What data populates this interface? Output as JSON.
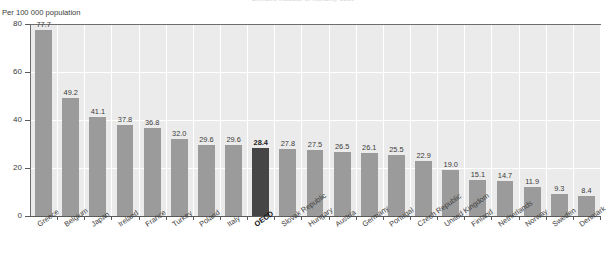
{
  "axis_unit_label": "Per 100 000 population",
  "clipped_title": "Selected indicator of mortality, 2009",
  "colors": {
    "bar": "#9b9b9b",
    "bar_highlight": "#454545",
    "plot_background": "#ebebeb",
    "gridline": "#ffffff",
    "axis": "#5a5a5a",
    "text": "#3b3b3b"
  },
  "chart_data": {
    "type": "bar",
    "title": "Selected indicator of mortality, 2009",
    "xlabel": "",
    "ylabel": "Per 100 000 population",
    "ylim": [
      0,
      80
    ],
    "yticks": [
      0,
      20,
      40,
      60,
      80
    ],
    "grid": true,
    "legend": "none",
    "highlight_category": "OECD",
    "categories": [
      "Greece",
      "Belgium",
      "Japan",
      "Ireland",
      "France",
      "Turkey",
      "Poland",
      "Italy",
      "OECD",
      "Slovak Republic",
      "Hungary",
      "Austria",
      "Germany",
      "Portugal",
      "Czech Republic",
      "United Kingdom",
      "Finland",
      "Netherlands",
      "Norway",
      "Sweden",
      "Denmark"
    ],
    "values": [
      77.7,
      49.2,
      41.1,
      37.8,
      36.8,
      32.0,
      29.6,
      29.6,
      28.4,
      27.8,
      27.5,
      26.5,
      26.1,
      25.5,
      22.9,
      19.0,
      15.1,
      14.7,
      11.9,
      9.3,
      8.4
    ],
    "value_labels": [
      "77.7",
      "49.2",
      "41.1",
      "37.8",
      "36.8",
      "32.0",
      "29.6",
      "29.6",
      "28.4",
      "27.8",
      "27.5",
      "26.5",
      "26.1",
      "25.5",
      "22.9",
      "19.0",
      "15.1",
      "14.7",
      "11.9",
      "9.3",
      "8.4"
    ],
    "ytick_labels": [
      "0",
      "20",
      "40",
      "60",
      "80"
    ]
  }
}
